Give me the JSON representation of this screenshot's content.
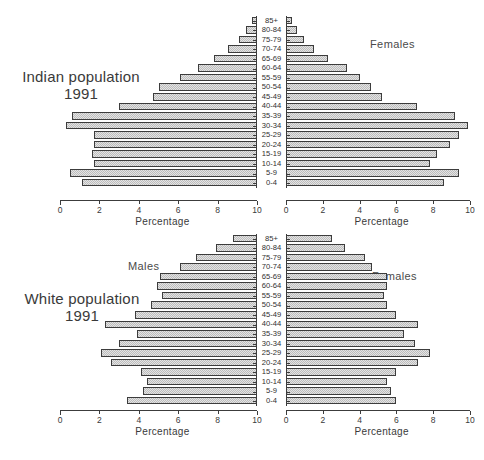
{
  "figure": {
    "age_groups": [
      "85+",
      "80-84",
      "75-79",
      "70-74",
      "65-69",
      "60-64",
      "55-59",
      "50-54",
      "45-49",
      "40-44",
      "35-39",
      "30-34",
      "25-29",
      "20-24",
      "15-19",
      "10-14",
      "5-9",
      "0-4"
    ],
    "axis_title": "Percentage",
    "tick_labels_left": [
      "10",
      "8",
      "6",
      "4",
      "2",
      "0"
    ],
    "tick_labels_right": [
      "0",
      "2",
      "4",
      "6",
      "8",
      "10"
    ],
    "axis_max": 10
  },
  "panels": [
    {
      "id": "indian",
      "title_line1": "Indian population",
      "title_line2": "1991",
      "males_label": "",
      "females_label": "Females"
    },
    {
      "id": "white",
      "title_line1": "White population",
      "title_line2": "1991",
      "males_label": "Males",
      "females_label": "Females"
    }
  ],
  "chart_data": [
    {
      "type": "bar",
      "subtype": "population-pyramid",
      "title": "Indian population 1991",
      "xlabel": "Percentage",
      "ylabel": "Age group",
      "xlim": [
        0,
        10
      ],
      "xticks": [
        0,
        2,
        4,
        6,
        8,
        10
      ],
      "grid": false,
      "legend": [
        "Males",
        "Females"
      ],
      "legend_position": "inside-top",
      "categories": [
        "85+",
        "80-84",
        "75-79",
        "70-74",
        "65-69",
        "60-64",
        "55-59",
        "50-54",
        "45-49",
        "40-44",
        "35-39",
        "30-34",
        "25-29",
        "20-24",
        "15-19",
        "10-14",
        "5-9",
        "0-4"
      ],
      "series": [
        {
          "name": "Males",
          "side": "left",
          "values": [
            0.25,
            0.55,
            0.9,
            1.45,
            2.2,
            3.0,
            3.9,
            5.0,
            5.3,
            7.0,
            9.4,
            9.7,
            8.3,
            8.3,
            8.4,
            8.3,
            9.5,
            8.9
          ]
        },
        {
          "name": "Females",
          "side": "right",
          "values": [
            0.3,
            0.6,
            1.0,
            1.5,
            2.3,
            3.3,
            4.0,
            4.6,
            5.2,
            7.1,
            9.2,
            9.9,
            9.4,
            8.9,
            8.2,
            7.8,
            9.4,
            8.6
          ]
        }
      ]
    },
    {
      "type": "bar",
      "subtype": "population-pyramid",
      "title": "White population 1991",
      "xlabel": "Percentage",
      "ylabel": "Age group",
      "xlim": [
        0,
        10
      ],
      "xticks": [
        0,
        2,
        4,
        6,
        8,
        10
      ],
      "grid": false,
      "legend": [
        "Males",
        "Females"
      ],
      "legend_position": "inside-top",
      "categories": [
        "85+",
        "80-84",
        "75-79",
        "70-74",
        "65-69",
        "60-64",
        "55-59",
        "50-54",
        "45-49",
        "40-44",
        "35-39",
        "30-34",
        "25-29",
        "20-24",
        "15-19",
        "10-14",
        "5-9",
        "0-4"
      ],
      "series": [
        {
          "name": "Males",
          "side": "left",
          "values": [
            1.2,
            2.1,
            3.1,
            3.9,
            4.9,
            5.1,
            4.8,
            5.4,
            6.2,
            7.7,
            6.1,
            7.0,
            7.9,
            7.4,
            5.9,
            5.6,
            5.8,
            6.6
          ]
        },
        {
          "name": "Females",
          "side": "right",
          "values": [
            2.5,
            3.2,
            4.3,
            4.7,
            5.5,
            5.5,
            5.3,
            5.5,
            6.0,
            7.2,
            6.4,
            7.0,
            7.8,
            7.2,
            6.0,
            5.5,
            5.7,
            6.0
          ]
        }
      ]
    }
  ]
}
